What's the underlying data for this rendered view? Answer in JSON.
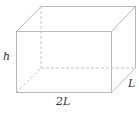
{
  "figure": {
    "type": "rectangular-box-diagram",
    "labels": {
      "height": "h",
      "width": "2L",
      "depth": "L"
    },
    "colors": {
      "edge": "#b8b8b8",
      "hidden_edge": "#c4c4c4",
      "label": "#333333",
      "background": "#ffffff"
    }
  }
}
